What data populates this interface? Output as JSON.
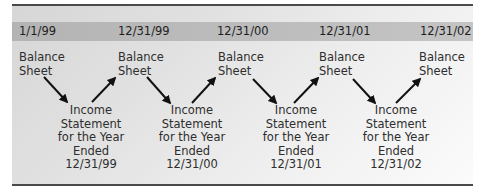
{
  "dates": [
    "1/1/99",
    "12/31/99",
    "12/31/00",
    "12/31/01",
    "12/31/02"
  ],
  "balance_sheets": [
    {
      "line1": "Balance",
      "line2": "Sheet"
    },
    {
      "line1": "Balance",
      "line2": "Sheet"
    },
    {
      "line1": "Balance",
      "line2": "Sheet"
    },
    {
      "line1": "Balance",
      "line2": "Sheet"
    },
    {
      "line1": "Balance",
      "line2": "Sheet"
    }
  ],
  "income_statements": [
    {
      "line1": "Income",
      "line2": "Statement",
      "line3": "for the Year",
      "line4": "Ended",
      "line5": "12/31/99"
    },
    {
      "line1": "Income",
      "line2": "Statement",
      "line3": "for the Year",
      "line4": "Ended",
      "line5": "12/31/00"
    },
    {
      "line1": "Income",
      "line2": "Statement",
      "line3": "for the Year",
      "line4": "Ended",
      "line5": "12/31/01"
    },
    {
      "line1": "Income",
      "line2": "Statement",
      "line3": "for the Year",
      "line4": "Ended",
      "line5": "12/31/02"
    }
  ],
  "colors": {
    "band": "#b8b8b8",
    "rule": "#4a4a4a",
    "arrow": "#111111",
    "text": "#2a2a2a"
  }
}
